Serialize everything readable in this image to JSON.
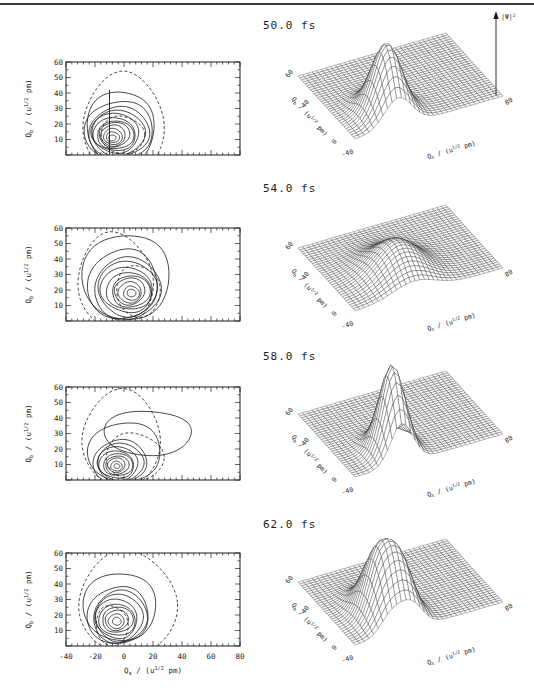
{
  "page": {
    "background": "#ffffff",
    "rule_color": "#3a3a3a",
    "ink": "#1c1c1c"
  },
  "chart_data": {
    "type": "contour+surface3d",
    "x_axis": {
      "label_main": "Q",
      "label_sub": "s",
      "unit_prefix": " / (u",
      "unit_sup": "1/2",
      "unit_suffix": " pm)",
      "range": [
        -40,
        80
      ],
      "ticks": [
        -40,
        -20,
        0,
        20,
        40,
        60,
        80
      ]
    },
    "y_axis": {
      "label_main": "Q",
      "label_sub": "b",
      "unit_prefix": " / (u",
      "unit_sup": "1/2",
      "unit_suffix": " pm)",
      "range": [
        0,
        60
      ],
      "ticks": [
        10,
        20,
        30,
        40,
        50,
        60
      ]
    },
    "z_axis": {
      "label_main": "|Ψ|",
      "label_sup": "2"
    },
    "surface_ticks": {
      "qb": [
        "0",
        "40",
        "60"
      ],
      "qs_start": "-40",
      "qs_end": "80"
    },
    "rows": [
      {
        "time": "50.0 fs",
        "contour": {
          "rings": [
            [
              -8,
              11,
              2.5,
              2,
              0
            ],
            [
              -8,
              11.5,
              4.5,
              3.5,
              0
            ],
            [
              -7.5,
              12,
              6.5,
              5,
              0
            ],
            [
              -7,
              12.5,
              8.5,
              6.5,
              0
            ],
            [
              -7,
              13,
              10.5,
              8,
              0
            ],
            [
              -6.5,
              13,
              12.5,
              9.5,
              0
            ],
            [
              -6,
              13.5,
              14.5,
              11,
              0
            ],
            [
              -5.5,
              14,
              16.5,
              12.5,
              0
            ],
            [
              -5,
              14,
              18.5,
              14,
              0
            ],
            [
              -4,
              15,
              21,
              16,
              0
            ],
            [
              -2,
              16,
              23.5,
              19.5,
              0
            ],
            [
              -2,
              17,
              23,
              25,
              0
            ],
            [
              -2,
              13,
              15,
              12,
              1
            ],
            [
              0,
              20,
              28,
              32,
              1
            ]
          ],
          "vline": {
            "x": -10,
            "y0": 0,
            "y1": 42
          }
        },
        "surface": {
          "peaks": [
            {
              "qs": -5,
              "qb": 12,
              "amp": 1.0,
              "sx": 11,
              "sy": 9
            }
          ],
          "z_arrow": true
        }
      },
      {
        "time": "54.0 fs",
        "contour": {
          "rings": [
            [
              5,
              18,
              3,
              2.5,
              0
            ],
            [
              5,
              18,
              5.5,
              4.5,
              0
            ],
            [
              4.5,
              18.5,
              8,
              6.5,
              0
            ],
            [
              4,
              19,
              10.5,
              8.5,
              0
            ],
            [
              4,
              19,
              13,
              10.5,
              0
            ],
            [
              3.5,
              19.5,
              15.5,
              12.5,
              0
            ],
            [
              3,
              20,
              18,
              14.5,
              0
            ],
            [
              2,
              20.5,
              20.5,
              17,
              0
            ],
            [
              1,
              21,
              23,
              19.5,
              0
            ],
            [
              0,
              24,
              24,
              23,
              0
            ],
            [
              3,
              28,
              30,
              29,
              0
            ],
            [
              9,
              19,
              15,
              17,
              1
            ],
            [
              -7,
              26,
              26,
              30,
              1
            ]
          ],
          "vline": null
        },
        "surface": {
          "peaks": [
            {
              "qs": 8,
              "qb": 18,
              "amp": 0.48,
              "sx": 17,
              "sy": 13
            }
          ],
          "z_arrow": false
        }
      },
      {
        "time": "58.0 fs",
        "contour": {
          "rings": [
            [
              -5,
              9,
              2,
              1.5,
              0
            ],
            [
              -5,
              9,
              4,
              3,
              0
            ],
            [
              -5,
              9.5,
              6,
              4.5,
              0
            ],
            [
              -5,
              9.5,
              8,
              6,
              0
            ],
            [
              -4.5,
              10,
              10,
              7.5,
              0
            ],
            [
              -4.5,
              10,
              12,
              9,
              0
            ],
            [
              -4,
              10.5,
              14,
              10.5,
              0
            ],
            [
              -3.5,
              11,
              16,
              12,
              0
            ],
            [
              -3,
              12,
              18.5,
              14,
              0
            ],
            [
              2,
              18,
              25,
              20,
              0
            ],
            [
              16,
              30,
              30,
              15,
              0
            ],
            [
              6,
              15,
              20,
              15,
              1
            ],
            [
              -1,
              27,
              27,
              30,
              1
            ]
          ],
          "vline": null
        },
        "surface": {
          "peaks": [
            {
              "qs": -2,
              "qb": 10,
              "amp": 1.25,
              "sx": 9,
              "sy": 8
            }
          ],
          "z_arrow": false
        }
      },
      {
        "time": "62.0 fs",
        "contour": {
          "rings": [
            [
              -5,
              16,
              3,
              2.5,
              0
            ],
            [
              -5,
              16,
              5.5,
              4.5,
              0
            ],
            [
              -5,
              16.5,
              8,
              6.5,
              0
            ],
            [
              -5,
              17,
              10.5,
              8.5,
              0
            ],
            [
              -4.5,
              17,
              12.5,
              10.5,
              0
            ],
            [
              -4.5,
              17.5,
              14.5,
              12.5,
              0
            ],
            [
              -4,
              18,
              16.5,
              14.5,
              0
            ],
            [
              -3.5,
              19,
              18.5,
              16.5,
              0
            ],
            [
              -3,
              20,
              21,
              19,
              0
            ],
            [
              -2,
              25,
              25,
              23,
              0
            ],
            [
              -9,
              13,
              11,
              13,
              1
            ],
            [
              2,
              28,
              34,
              32,
              1
            ]
          ],
          "vline": null
        },
        "surface": {
          "peaks": [
            {
              "qs": -10,
              "qb": 16,
              "amp": 0.85,
              "sx": 9,
              "sy": 11
            },
            {
              "qs": 6,
              "qb": 13,
              "amp": 0.8,
              "sx": 9,
              "sy": 10
            }
          ],
          "z_arrow": false
        }
      }
    ]
  }
}
